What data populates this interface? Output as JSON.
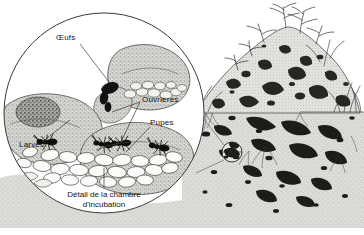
{
  "illustration": {
    "title": "Coupe d'une fourmilière avec détail de la chambre d'incubation",
    "style": "pen-and-ink line drawing, stippled, black and white",
    "width": 364,
    "height": 235
  },
  "colors": {
    "paper": "#ffffff",
    "ink": "#111111",
    "soil_light": "#d9d9d6",
    "soil_mid": "#b3b3ae",
    "soil_dark": "#6b6b66",
    "gallery_black": "#1a1a1a",
    "grass": "#2a2a2a"
  },
  "labels": [
    {
      "id": "eggs",
      "text": "Œufs",
      "x": 56,
      "y": 38
    },
    {
      "id": "workers",
      "text": "Ouvrières",
      "x": 142,
      "y": 100
    },
    {
      "id": "pupae",
      "text": "Pupes",
      "x": 150,
      "y": 123
    },
    {
      "id": "larvae",
      "text": "Larves",
      "x": 19,
      "y": 145
    }
  ],
  "caption": {
    "line1": "Détail de la chambre",
    "line2": "d'incubation",
    "x": 104,
    "y": 192
  },
  "detail_circle": {
    "name": "incubation-chamber-detail",
    "cx": 104,
    "cy": 113,
    "r": 101
  },
  "magnifier_marker": {
    "name": "detail-location-marker",
    "cx": 232,
    "cy": 152,
    "r": 11
  },
  "mound": {
    "name": "ant-mound-cross-section",
    "ground_line_y": 112,
    "apex_x": 286,
    "apex_y": 28
  },
  "scene_parts": [
    {
      "id": "nest-mound",
      "label": "Ant mound (dôme de la fourmilière)"
    },
    {
      "id": "underground-galleries",
      "label": "Galeries souterraines"
    },
    {
      "id": "vegetation",
      "label": "Herbes et plantes"
    },
    {
      "id": "brood-chamber",
      "label": "Chambre d'incubation"
    }
  ]
}
